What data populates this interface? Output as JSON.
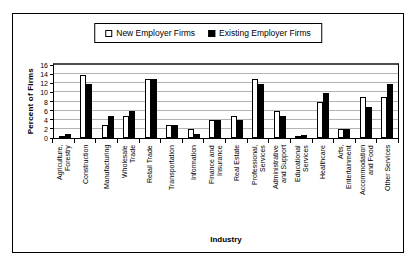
{
  "chart_data": {
    "type": "bar",
    "title": "",
    "xlabel": "Industry",
    "ylabel": "Percent of Firms",
    "ylim": [
      0,
      16
    ],
    "ytick_step": 2,
    "yticks": [
      16,
      14,
      12,
      10,
      8,
      6,
      4,
      2,
      0
    ],
    "grid": true,
    "legend_position": "top-center",
    "colors": {
      "new_employer_firms": "#ffffff",
      "existing_employer_firms": "#000000",
      "gridline": "#b3b3b3",
      "border": "#000000"
    },
    "categories": [
      "Agriculture,\nForestry",
      "Construction",
      "Manufacturing",
      "Wholesale\nTrade",
      "Retail Trade",
      "Transportation",
      "Information",
      "Finance and\nInsurance",
      "Real Estate",
      "Professional,\nServices",
      "Administrative\nand Support",
      "Educational\nServices",
      "Healthcare",
      "Arts,\nEntertainment",
      "Accommodation\nand Food",
      "Other Services"
    ],
    "series": [
      {
        "name": "New Employer Firms",
        "fill": "#ffffff",
        "values": [
          0.2,
          13.8,
          2.9,
          4.9,
          12.9,
          2.9,
          1.9,
          3.9,
          4.9,
          12.9,
          5.9,
          0.5,
          7.9,
          1.9,
          8.9,
          8.9
        ]
      },
      {
        "name": "Existing Employer Firms",
        "fill": "#000000",
        "values": [
          0.9,
          11.9,
          4.9,
          5.9,
          13.0,
          2.8,
          0.9,
          4.0,
          3.9,
          11.9,
          4.9,
          0.6,
          9.9,
          1.9,
          6.9,
          11.9
        ]
      }
    ]
  }
}
